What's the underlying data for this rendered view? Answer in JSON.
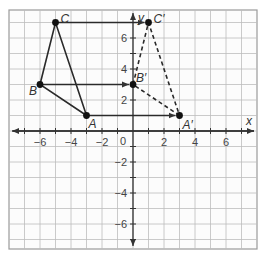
{
  "diagram": {
    "type": "coordinate-grid-translation",
    "grid": {
      "xmin": -8,
      "xmax": 8,
      "ymin": -8,
      "ymax": 8
    },
    "axes": {
      "x_label": "x",
      "y_label": "y",
      "origin_label": "0"
    },
    "x_ticks": [
      {
        "v": -6,
        "label": "−6"
      },
      {
        "v": -4,
        "label": "−4"
      },
      {
        "v": -2,
        "label": "−2"
      },
      {
        "v": 2,
        "label": "2"
      },
      {
        "v": 4,
        "label": "4"
      },
      {
        "v": 6,
        "label": "6"
      }
    ],
    "y_ticks": [
      {
        "v": 6,
        "label": "6"
      },
      {
        "v": 4,
        "label": "4"
      },
      {
        "v": 2,
        "label": "2"
      },
      {
        "v": -2,
        "label": "−2"
      },
      {
        "v": -4,
        "label": "−4"
      },
      {
        "v": -6,
        "label": "−6"
      }
    ],
    "original_triangle": {
      "style": "solid",
      "points": [
        {
          "name": "A",
          "x": -3,
          "y": 1
        },
        {
          "name": "B",
          "x": -6,
          "y": 3
        },
        {
          "name": "C",
          "x": -5,
          "y": 7
        }
      ]
    },
    "image_triangle": {
      "style": "dashed",
      "points": [
        {
          "name": "A′",
          "x": 3,
          "y": 1
        },
        {
          "name": "B′",
          "x": 0,
          "y": 3
        },
        {
          "name": "C′",
          "x": 1,
          "y": 7
        }
      ]
    },
    "translation_arrows": [
      {
        "from": "A",
        "to": "A′"
      },
      {
        "from": "B",
        "to": "B′"
      },
      {
        "from": "C",
        "to": "C′"
      }
    ],
    "colors": {
      "grid": "#bdbdbd",
      "axis": "#333333",
      "figure": "#2a2a2a",
      "border": "#9a9a9a"
    }
  }
}
